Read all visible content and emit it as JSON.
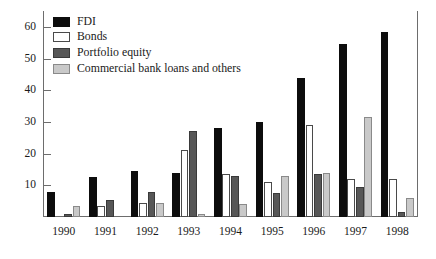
{
  "chart_data": {
    "type": "bar",
    "title": "",
    "xlabel": "",
    "ylabel": "",
    "ylim": [
      0,
      65
    ],
    "yticks": [
      10,
      20,
      30,
      40,
      50,
      60
    ],
    "grid": false,
    "legend_position": "top-left",
    "categories": [
      "1990",
      "1991",
      "1992",
      "1993",
      "1994",
      "1995",
      "1996",
      "1997",
      "1998"
    ],
    "series": [
      {
        "name": "FDI",
        "color": "#0d0d0d",
        "values": [
          8,
          12.5,
          14.5,
          14,
          28,
          30,
          44,
          54.5,
          58.5
        ]
      },
      {
        "name": "Bonds",
        "color": "#ffffff",
        "values": [
          0,
          3.5,
          4.5,
          21,
          13.5,
          11,
          29,
          12,
          12
        ]
      },
      {
        "name": "Portfolio equity",
        "color": "#575757",
        "values": [
          1,
          5.5,
          8,
          27,
          13,
          7.5,
          13.5,
          9.5,
          1.5
        ]
      },
      {
        "name": "Commercial bank loans and others",
        "color": "#c9c9c9",
        "values": [
          3.5,
          0,
          4.5,
          1,
          4,
          13,
          14,
          31.5,
          6
        ]
      }
    ]
  },
  "legend": {
    "items": [
      {
        "label": "FDI",
        "swatch": "fdi"
      },
      {
        "label": "Bonds",
        "swatch": "bonds"
      },
      {
        "label": "Portfolio equity",
        "swatch": "portfolio"
      },
      {
        "label": "Commercial bank loans and others",
        "swatch": "commercial"
      }
    ]
  }
}
